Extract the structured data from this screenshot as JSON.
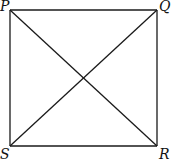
{
  "diagram": {
    "shape": "square",
    "stroke_color": "#1a1a1a",
    "vertices": [
      {
        "label": "P",
        "x": 10,
        "y": 10,
        "lx": 0,
        "ly": 11
      },
      {
        "label": "Q",
        "x": 157,
        "y": 10,
        "lx": 159,
        "ly": 11
      },
      {
        "label": "R",
        "x": 157,
        "y": 146,
        "lx": 159,
        "ly": 159
      },
      {
        "label": "S",
        "x": 10,
        "y": 146,
        "lx": 0,
        "ly": 159
      }
    ],
    "edges": [
      [
        "P",
        "Q"
      ],
      [
        "Q",
        "R"
      ],
      [
        "R",
        "S"
      ],
      [
        "S",
        "P"
      ]
    ],
    "diagonals": [
      [
        "P",
        "R"
      ],
      [
        "Q",
        "S"
      ]
    ]
  }
}
